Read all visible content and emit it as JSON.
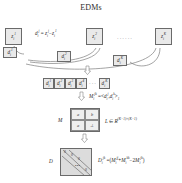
{
  "figure": {
    "title": "EDMs",
    "type": "pipeline-diagram"
  },
  "stage_top": {
    "features": [
      {
        "name": "feature-token-1",
        "base": "z",
        "sub": "i",
        "sup": "1"
      },
      {
        "name": "feature-token-2",
        "base": "z",
        "sub": "i",
        "sup": "2"
      },
      {
        "name": "feature-token-K",
        "base": "z",
        "sub": "i",
        "sup": "K"
      }
    ],
    "ellipsis": "······",
    "equation": {
      "lhs": "d",
      "lhs_sub": "i",
      "lhs_sup": "j",
      "eq": "=",
      "rhs1": "z",
      "rhs1_sub": "i",
      "rhs1_sup": "j",
      "minus": "−",
      "rhs2": "z",
      "rhs2_sub": "i",
      "rhs2_sup": "1"
    },
    "diffs": [
      {
        "name": "diff-token-1",
        "base": "d",
        "sub": "i",
        "sup": "1"
      },
      {
        "name": "diff-token-2",
        "base": "d",
        "sub": "i",
        "sup": "2"
      },
      {
        "name": "diff-token-K",
        "base": "d",
        "sub": "i",
        "sup": "K"
      }
    ]
  },
  "stage_row": {
    "items": [
      {
        "base": "d",
        "sub": "i",
        "sup": "1"
      },
      {
        "base": "d",
        "sub": "i",
        "sup": "2"
      },
      {
        "base": "d",
        "sub": "i",
        "sup": "3"
      },
      {
        "base": "d",
        "sub": "i",
        "sup": "4"
      }
    ],
    "ellipsis": "···",
    "last": {
      "base": "d",
      "sub": "i",
      "sup": "K"
    }
  },
  "stage_gram": {
    "equation": {
      "lhs": "M",
      "lhs_sub": "i",
      "lhs_sup": "jk",
      "eq": "=",
      "open": "<",
      "a": "d",
      "a_sub": "i",
      "a_sup": "j",
      "comma": ",",
      "b": "d",
      "b_sub": "i",
      "b_sup": "k",
      "close": ">",
      "close_sub": "1"
    },
    "matrix_label": "M",
    "cells": [
      "a",
      "b",
      "a",
      "⊥"
    ],
    "space_note": {
      "symbol": "L",
      "in": "∈",
      "field": "R",
      "exponent": "(K−1)×(K−1)"
    }
  },
  "stage_edm": {
    "matrix_label": "D",
    "zeros": [
      "0",
      "0",
      "0",
      "0"
    ],
    "inner_dots": "•••",
    "equation": {
      "lhs": "D",
      "lhs_sub": "i",
      "lhs_sup": "jk",
      "eq": "=",
      "open": "(",
      "t1": "M",
      "t1_sub": "i",
      "t1_sup": "jj",
      "plus": "+",
      "t2": "M",
      "t2_sub": "i",
      "t2_sup": "kk",
      "minus": "−",
      "coef": "2",
      "t3": "M",
      "t3_sub": "i",
      "t3_sup": "jk",
      "close": ")"
    }
  },
  "colors": {
    "tile_fill": "#e9e9e9",
    "matrix_fill": "#efefef",
    "edm_fill": "#dcdcdc",
    "stroke": "#6a6a6a",
    "text": "#2b2b2b"
  }
}
